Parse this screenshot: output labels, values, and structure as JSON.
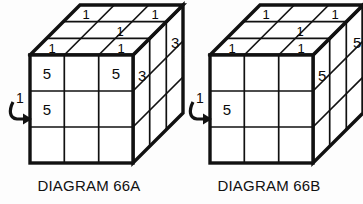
{
  "page": {
    "background_color": "#fdfdfd",
    "ink_color": "#111111"
  },
  "diagrams": [
    {
      "id": "66A",
      "caption": "DIAGRAM 66A",
      "rotation_arrow": {
        "label": "1",
        "direction": "clockwise-into-right",
        "points_to": "front-face-middle-row",
        "glyph": "curved-arrow-right"
      },
      "faces": {
        "front": {
          "name": "front-face",
          "rows": 3,
          "cols": 3,
          "cells": [
            [
              "5",
              "",
              "5"
            ],
            [
              "5",
              "",
              ""
            ],
            [
              "",
              "",
              ""
            ]
          ]
        },
        "top": {
          "name": "top-face",
          "rows": 3,
          "cols": 3,
          "cells": [
            [
              "1",
              "",
              "1"
            ],
            [
              "",
              "1",
              ""
            ],
            [
              "1",
              "",
              "1"
            ]
          ]
        },
        "right": {
          "name": "right-face",
          "rows": 3,
          "cols": 3,
          "cells": [
            [
              "3",
              "",
              "3"
            ],
            [
              "",
              "",
              ""
            ],
            [
              "",
              "",
              ""
            ]
          ]
        }
      }
    },
    {
      "id": "66B",
      "caption": "DIAGRAM 66B",
      "rotation_arrow": {
        "label": "1",
        "direction": "clockwise-into-right",
        "points_to": "front-face-middle-row",
        "glyph": "curved-arrow-right"
      },
      "faces": {
        "front": {
          "name": "front-face",
          "rows": 3,
          "cols": 3,
          "cells": [
            [
              "",
              "",
              ""
            ],
            [
              "5",
              "",
              ""
            ],
            [
              "",
              "",
              ""
            ]
          ]
        },
        "top": {
          "name": "top-face",
          "rows": 3,
          "cols": 3,
          "cells": [
            [
              "1",
              "",
              "1"
            ],
            [
              "",
              "1",
              ""
            ],
            [
              "1",
              "",
              "1"
            ]
          ]
        },
        "right": {
          "name": "right-face",
          "rows": 3,
          "cols": 3,
          "cells": [
            [
              "5",
              "",
              "5"
            ],
            [
              "",
              "",
              ""
            ],
            [
              "",
              "",
              ""
            ]
          ]
        }
      }
    }
  ]
}
